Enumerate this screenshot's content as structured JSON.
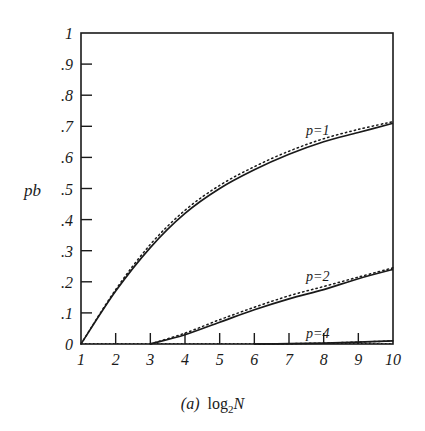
{
  "chart_data": {
    "type": "line",
    "title": "",
    "caption": "(a) log2N",
    "caption_tag": "(a)",
    "xlabel": "log2N",
    "ylabel": "pb",
    "xlim": [
      1,
      10
    ],
    "ylim": [
      0,
      1
    ],
    "x_ticks": [
      "1",
      "2",
      "3",
      "4",
      "5",
      "6",
      "7",
      "8",
      "9",
      "10"
    ],
    "y_ticks": [
      "0",
      ".1",
      ".2",
      ".3",
      ".4",
      ".5",
      ".6",
      ".7",
      ".8",
      ".9",
      "1"
    ],
    "grid": false,
    "legend": "inline labels",
    "x": [
      1,
      2,
      3,
      4,
      5,
      6,
      7,
      8,
      9,
      10
    ],
    "series": [
      {
        "name": "p=1",
        "style": "solid",
        "values": [
          0,
          0.17,
          0.31,
          0.42,
          0.5,
          0.56,
          0.61,
          0.65,
          0.68,
          0.71
        ]
      },
      {
        "name": "p=1 (dotted)",
        "style": "dotted",
        "values": [
          0,
          0.175,
          0.32,
          0.43,
          0.51,
          0.57,
          0.62,
          0.66,
          0.69,
          0.715
        ]
      },
      {
        "name": "p=2",
        "style": "solid",
        "values": [
          0,
          0,
          0,
          0.03,
          0.07,
          0.11,
          0.145,
          0.175,
          0.21,
          0.24
        ]
      },
      {
        "name": "p=2 (dotted)",
        "style": "dotted",
        "values": [
          0,
          0,
          0,
          0.035,
          0.078,
          0.118,
          0.155,
          0.185,
          0.215,
          0.245
        ]
      },
      {
        "name": "p=4",
        "style": "solid",
        "values": [
          0,
          0,
          0,
          0,
          0,
          0,
          0.001,
          0.003,
          0.006,
          0.01
        ]
      },
      {
        "name": "p=4 (dotted)",
        "style": "dotted",
        "values": [
          0,
          0,
          0,
          0,
          0,
          0,
          0.001,
          0.003,
          0.006,
          0.01
        ]
      }
    ],
    "annotations": [
      {
        "text": "p=1",
        "x": 8.3,
        "y": 0.745
      },
      {
        "text": "p=2",
        "x": 8.3,
        "y": 0.275
      },
      {
        "text": "p=4",
        "x": 8.3,
        "y": 0.025
      }
    ]
  },
  "labels": {
    "ylabel": "pb",
    "caption_tag": "(a)",
    "caption_log": "log",
    "caption_sub": "2",
    "caption_var": "N",
    "curve_p1": "p=1",
    "curve_p2": "p=2",
    "curve_p4": "p=4"
  },
  "colors": {
    "ink": "#1a1a1a",
    "background": "#ffffff"
  }
}
